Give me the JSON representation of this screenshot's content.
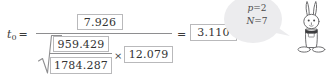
{
  "equation": {
    "lhs_symbol": "t",
    "lhs_subscript": "0",
    "lhs_equals": "=",
    "numerator_value": "7.926",
    "inner_numerator_value": "959.429",
    "inner_denominator_value": "1784.287",
    "times_symbol": "×",
    "multiplier_value": "12.079",
    "result_equals": "=",
    "result_value": "3.110"
  },
  "callout": {
    "line1_variable": "p",
    "line1_operator": "=",
    "line1_value": "2",
    "line2_variable": "N",
    "line2_operator": "=",
    "line2_value": "7"
  },
  "colors": {
    "box_border": "#b9b9bb",
    "rule_line": "#8e8e90",
    "text": "#3a3a3a",
    "bubble_fill": "#ececed",
    "character_outline": "#6f6f71",
    "page_background": "#ffffff"
  }
}
